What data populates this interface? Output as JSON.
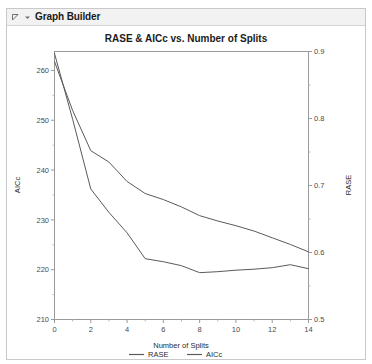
{
  "window": {
    "title": "Graph Builder",
    "disclosure_icon": "triangle-collapse-icon",
    "dropdown_icon": "chevron-down-icon"
  },
  "chart_data": {
    "type": "line",
    "title": "RASE & AICc vs. Number of Splits",
    "xlabel": "Number of Splits",
    "ylabel": "AICc",
    "y2label": "RASE",
    "grid": false,
    "legend_position": "bottom",
    "x": [
      0,
      1,
      2,
      3,
      4,
      5,
      6,
      7,
      8,
      9,
      10,
      11,
      12,
      13,
      14
    ],
    "xlim": [
      0,
      14
    ],
    "xticks": [
      0,
      2,
      4,
      6,
      8,
      10,
      12,
      14
    ],
    "xticklabels": [
      "0",
      "2",
      "4",
      "6",
      "8",
      "10",
      "12",
      "14"
    ],
    "ylim": [
      210,
      263.8
    ],
    "yticks": [
      210,
      220,
      230,
      240,
      250,
      260
    ],
    "yticklabels": [
      "210",
      "220",
      "230",
      "240",
      "250",
      "260"
    ],
    "y2lim": [
      0.5,
      0.9
    ],
    "y2ticks": [
      0.5,
      0.6,
      0.7,
      0.8,
      0.9
    ],
    "y2ticklabels": [
      "0.5",
      "0.6",
      "0.7",
      "0.8",
      "0.9"
    ],
    "series": [
      {
        "name": "RASE",
        "axis": "right",
        "color": "#5a5a5a",
        "values": [
          0.885,
          0.812,
          0.752,
          0.735,
          0.706,
          0.688,
          0.679,
          0.668,
          0.655,
          0.647,
          0.64,
          0.632,
          0.622,
          0.612,
          0.601
        ]
      },
      {
        "name": "AICc",
        "axis": "left",
        "color": "#5a5a5a",
        "values": [
          263.4,
          250.2,
          236.2,
          231.5,
          227.4,
          222.2,
          221.6,
          220.8,
          219.4,
          219.6,
          219.9,
          220.1,
          220.4,
          221.0,
          220.2
        ]
      }
    ],
    "legend": [
      {
        "label": "RASE",
        "color": "#5a5a5a"
      },
      {
        "label": "AICc",
        "color": "#5a5a5a"
      }
    ]
  }
}
